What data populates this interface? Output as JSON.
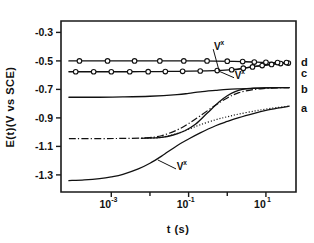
{
  "chart_data": {
    "type": "line",
    "title": "",
    "xlabel": "t (s)",
    "ylabel": "E(t)(V vs SCE)",
    "xscale": "log",
    "xlim": [
      5e-05,
      60
    ],
    "ylim": [
      -0.22,
      -1.42
    ],
    "grid": false,
    "legend_position": "right-outside",
    "xticks": [
      {
        "value": 0.001,
        "mantissa": "10",
        "exponent": "-3",
        "label": "10^-3"
      },
      {
        "value": 0.1,
        "mantissa": "10",
        "exponent": "-1",
        "label": "10^-1"
      },
      {
        "value": 10,
        "mantissa": "10",
        "exponent": "1",
        "label": "10^1"
      }
    ],
    "xminorticks": [
      0.01,
      1.0
    ],
    "yticks": [
      {
        "value": -1.3,
        "label": "-1.3"
      },
      {
        "value": -1.1,
        "label": "-1.1"
      },
      {
        "value": -0.9,
        "label": "-0.9"
      },
      {
        "value": -0.7,
        "label": "-0.7"
      },
      {
        "value": -0.5,
        "label": "-0.5"
      },
      {
        "value": -0.3,
        "label": "-0.3"
      }
    ],
    "annotations": [
      {
        "id": "vx-top",
        "text": "V",
        "superscript": "x",
        "x": 0.06,
        "y": -1.265
      },
      {
        "id": "vx-mid",
        "text": "V",
        "superscript": "x",
        "x": 1.9,
        "y": -0.625
      },
      {
        "id": "vx-low",
        "text": "V",
        "superscript": "x",
        "x": 0.55,
        "y": -0.425
      }
    ],
    "series": [
      {
        "name": "a",
        "label": "a",
        "style": "solid",
        "marker": "none",
        "label_y": -0.83,
        "points": [
          [
            8e-05,
            -1.34
          ],
          [
            0.0002,
            -1.335
          ],
          [
            0.0005,
            -1.326
          ],
          [
            0.001,
            -1.314
          ],
          [
            0.002,
            -1.296
          ],
          [
            0.005,
            -1.258
          ],
          [
            0.01,
            -1.218
          ],
          [
            0.02,
            -1.168
          ],
          [
            0.05,
            -1.095
          ],
          [
            0.1,
            -1.048
          ],
          [
            0.2,
            -1.005
          ],
          [
            0.5,
            -0.955
          ],
          [
            1.0,
            -0.925
          ],
          [
            2.0,
            -0.898
          ],
          [
            5.0,
            -0.868
          ],
          [
            10.0,
            -0.848
          ],
          [
            20.0,
            -0.832
          ],
          [
            40.0,
            -0.818
          ]
        ]
      },
      {
        "name": "b",
        "label": "b",
        "style": "solid",
        "marker": "none",
        "label_y": -0.7,
        "points": [
          [
            8e-05,
            -0.755
          ],
          [
            0.0005,
            -0.755
          ],
          [
            0.002,
            -0.753
          ],
          [
            0.01,
            -0.748
          ],
          [
            0.05,
            -0.737
          ],
          [
            0.1,
            -0.728
          ],
          [
            0.2,
            -0.717
          ],
          [
            0.5,
            -0.707
          ],
          [
            1.0,
            -0.7
          ],
          [
            2.0,
            -0.696
          ],
          [
            5.0,
            -0.692
          ],
          [
            10.0,
            -0.69
          ],
          [
            20.0,
            -0.688
          ],
          [
            40.0,
            -0.687
          ]
        ]
      },
      {
        "name": "c",
        "label": "c",
        "style": "solid",
        "marker": "circle",
        "label_y": -0.588,
        "points": [
          [
            8e-05,
            -0.576
          ],
          [
            0.0003,
            -0.576
          ],
          [
            0.001,
            -0.576
          ],
          [
            0.003,
            -0.576
          ],
          [
            0.01,
            -0.575
          ],
          [
            0.03,
            -0.574
          ],
          [
            0.1,
            -0.572
          ],
          [
            0.3,
            -0.57
          ],
          [
            0.7,
            -0.566
          ],
          [
            1.5,
            -0.56
          ],
          [
            3.0,
            -0.549
          ],
          [
            6.0,
            -0.537
          ],
          [
            12.0,
            -0.527
          ],
          [
            25.0,
            -0.518
          ],
          [
            40.0,
            -0.514
          ]
        ],
        "marker_points": [
          [
            0.00012,
            -0.576
          ],
          [
            0.00035,
            -0.576
          ],
          [
            0.001,
            -0.576
          ],
          [
            0.003,
            -0.576
          ],
          [
            0.009,
            -0.5755
          ],
          [
            0.025,
            -0.575
          ],
          [
            0.07,
            -0.573
          ],
          [
            0.2,
            -0.571
          ],
          [
            0.55,
            -0.568
          ],
          [
            1.3,
            -0.562
          ],
          [
            2.6,
            -0.551
          ],
          [
            4.5,
            -0.542
          ],
          [
            8.0,
            -0.533
          ],
          [
            14.0,
            -0.525
          ],
          [
            24.0,
            -0.519
          ],
          [
            38.0,
            -0.515
          ]
        ]
      },
      {
        "name": "d",
        "label": "d",
        "style": "solid",
        "marker": "circle",
        "label_y": -0.51,
        "points": [
          [
            8e-05,
            -0.5
          ],
          [
            0.0005,
            -0.5
          ],
          [
            0.003,
            -0.5
          ],
          [
            0.02,
            -0.5
          ],
          [
            0.1,
            -0.5
          ],
          [
            0.5,
            -0.501
          ],
          [
            1.5,
            -0.503
          ],
          [
            3.0,
            -0.506
          ],
          [
            6.0,
            -0.509
          ],
          [
            12.0,
            -0.511
          ],
          [
            25.0,
            -0.512
          ],
          [
            40.0,
            -0.512
          ]
        ],
        "marker_points": [
          [
            0.00015,
            -0.5
          ],
          [
            0.0008,
            -0.5
          ],
          [
            0.004,
            -0.5
          ],
          [
            0.018,
            -0.5
          ],
          [
            0.075,
            -0.5
          ],
          [
            0.3,
            -0.5005
          ],
          [
            1.0,
            -0.502
          ],
          [
            2.5,
            -0.505
          ],
          [
            5.0,
            -0.508
          ],
          [
            10.0,
            -0.51
          ],
          [
            20.0,
            -0.512
          ],
          [
            34.0,
            -0.512
          ]
        ]
      },
      {
        "name": "dashdot",
        "label": "",
        "style": "dash-dot",
        "marker": "none",
        "points": [
          [
            8e-05,
            -1.045
          ],
          [
            0.0005,
            -1.045
          ],
          [
            0.002,
            -1.044
          ],
          [
            0.008,
            -1.04
          ],
          [
            0.02,
            -1.025
          ],
          [
            0.05,
            -0.985
          ],
          [
            0.1,
            -0.94
          ],
          [
            0.2,
            -0.885
          ],
          [
            0.5,
            -0.81
          ],
          [
            1.0,
            -0.76
          ],
          [
            2.0,
            -0.723
          ],
          [
            5.0,
            -0.7
          ],
          [
            10.0,
            -0.693
          ],
          [
            20.0,
            -0.689
          ],
          [
            40.0,
            -0.687
          ]
        ]
      },
      {
        "name": "dotted",
        "label": "",
        "style": "dotted",
        "marker": "none",
        "points": [
          [
            0.006,
            -1.043
          ],
          [
            0.015,
            -1.04
          ],
          [
            0.03,
            -1.027
          ],
          [
            0.06,
            -1.003
          ],
          [
            0.1,
            -0.98
          ],
          [
            0.2,
            -0.948
          ],
          [
            0.5,
            -0.913
          ],
          [
            1.0,
            -0.892
          ],
          [
            2.0,
            -0.873
          ],
          [
            5.0,
            -0.852
          ],
          [
            10.0,
            -0.838
          ],
          [
            20.0,
            -0.827
          ],
          [
            40.0,
            -0.818
          ]
        ]
      },
      {
        "name": "steep",
        "label": "",
        "style": "solid",
        "marker": "none",
        "points": [
          [
            0.006,
            -1.043
          ],
          [
            0.02,
            -1.036
          ],
          [
            0.04,
            -1.02
          ],
          [
            0.08,
            -0.99
          ],
          [
            0.15,
            -0.945
          ],
          [
            0.3,
            -0.868
          ],
          [
            0.6,
            -0.79
          ],
          [
            1.0,
            -0.745
          ],
          [
            1.6,
            -0.715
          ],
          [
            2.5,
            -0.7
          ],
          [
            4.0,
            -0.694
          ],
          [
            8.0,
            -0.69
          ],
          [
            16.0,
            -0.688
          ],
          [
            40.0,
            -0.687
          ]
        ]
      },
      {
        "name": "c-tail-extension",
        "label": "",
        "style": "solid",
        "marker": "none",
        "points": [
          [
            1.2,
            -0.566
          ],
          [
            2.0,
            -0.557
          ],
          [
            3.5,
            -0.546
          ],
          [
            6.0,
            -0.536
          ],
          [
            11.0,
            -0.526
          ],
          [
            20.0,
            -0.519
          ],
          [
            40.0,
            -0.513
          ]
        ]
      }
    ]
  }
}
